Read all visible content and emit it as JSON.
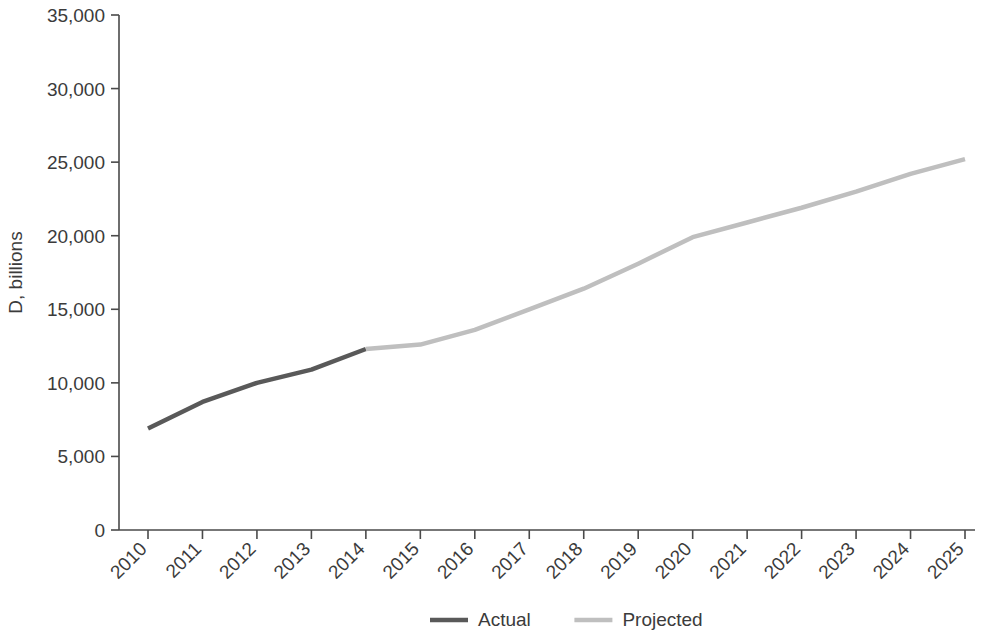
{
  "chart_data": {
    "type": "line",
    "title": "",
    "subtitle": "",
    "xlabel": "",
    "ylabel": "D, billions",
    "ylim": [
      0,
      35000
    ],
    "ytick_labels": [
      "0",
      "5,000",
      "10,000",
      "15,000",
      "20,000",
      "25,000",
      "30,000",
      "35,000"
    ],
    "ytick_values": [
      0,
      5000,
      10000,
      15000,
      20000,
      25000,
      30000,
      35000
    ],
    "grid": false,
    "legend_position": "bottom",
    "categories": [
      "2010",
      "2011",
      "2012",
      "2013",
      "2014",
      "2015",
      "2016",
      "2017",
      "2018",
      "2019",
      "2020",
      "2021",
      "2022",
      "2023",
      "2024",
      "2025"
    ],
    "x": [
      2010,
      2011,
      2012,
      2013,
      2014,
      2015,
      2016,
      2017,
      2018,
      2019,
      2020,
      2021,
      2022,
      2023,
      2024,
      2025
    ],
    "series": [
      {
        "name": "Actual",
        "color": "#595959",
        "values": [
          6900,
          8700,
          10000,
          10900,
          12300,
          null,
          null,
          null,
          null,
          null,
          null,
          null,
          null,
          null,
          null,
          null
        ]
      },
      {
        "name": "Projected",
        "color": "#bfbfbf",
        "values": [
          null,
          null,
          null,
          null,
          12300,
          12600,
          13600,
          15000,
          16400,
          18100,
          19900,
          20900,
          21900,
          23000,
          24200,
          25200
        ]
      }
    ],
    "legend": [
      {
        "label": "Actual",
        "color": "#595959"
      },
      {
        "label": "Projected",
        "color": "#bfbfbf"
      }
    ]
  }
}
